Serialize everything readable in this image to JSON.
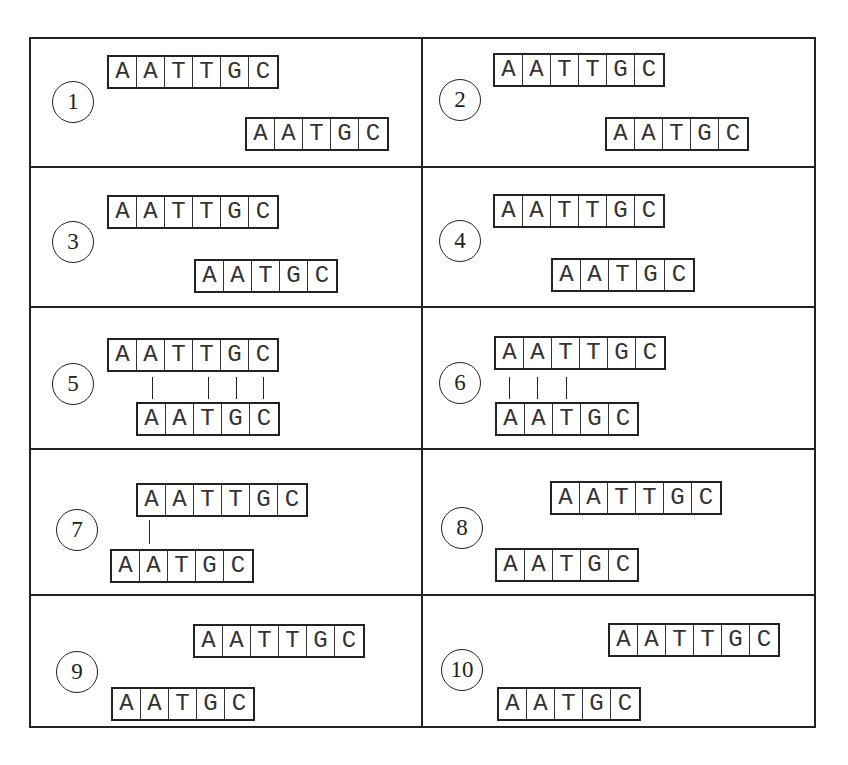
{
  "figure": {
    "frame": {
      "left": 29,
      "top": 37,
      "width": 787,
      "height": 691
    },
    "column_divider_x": 421,
    "row_divider_y": [
      166,
      306,
      448,
      594
    ],
    "cell_width": 28,
    "colors": {
      "line": "#222222",
      "text": "#333333",
      "background": "#ffffff"
    }
  },
  "panels": [
    {
      "number": "1",
      "circle": {
        "x": 73,
        "y": 102
      },
      "top_seq": {
        "x": 107,
        "y": 55,
        "letters": [
          "A",
          "A",
          "T",
          "T",
          "G",
          "C"
        ]
      },
      "bottom_seq": {
        "x": 245,
        "y": 117,
        "letters": [
          "A",
          "A",
          "T",
          "G",
          "C"
        ]
      },
      "pair_lines": []
    },
    {
      "number": "2",
      "circle": {
        "x": 460,
        "y": 100
      },
      "top_seq": {
        "x": 493,
        "y": 53,
        "letters": [
          "A",
          "A",
          "T",
          "T",
          "G",
          "C"
        ]
      },
      "bottom_seq": {
        "x": 605,
        "y": 117,
        "letters": [
          "A",
          "A",
          "T",
          "G",
          "C"
        ]
      },
      "pair_lines": []
    },
    {
      "number": "3",
      "circle": {
        "x": 73,
        "y": 242
      },
      "top_seq": {
        "x": 107,
        "y": 195,
        "letters": [
          "A",
          "A",
          "T",
          "T",
          "G",
          "C"
        ]
      },
      "bottom_seq": {
        "x": 194,
        "y": 259,
        "letters": [
          "A",
          "A",
          "T",
          "G",
          "C"
        ]
      },
      "pair_lines": []
    },
    {
      "number": "4",
      "circle": {
        "x": 460,
        "y": 241
      },
      "top_seq": {
        "x": 493,
        "y": 194,
        "letters": [
          "A",
          "A",
          "T",
          "T",
          "G",
          "C"
        ]
      },
      "bottom_seq": {
        "x": 551,
        "y": 258,
        "letters": [
          "A",
          "A",
          "T",
          "G",
          "C"
        ]
      },
      "pair_lines": []
    },
    {
      "number": "5",
      "circle": {
        "x": 73,
        "y": 384
      },
      "top_seq": {
        "x": 107,
        "y": 338,
        "letters": [
          "A",
          "A",
          "T",
          "T",
          "G",
          "C"
        ]
      },
      "bottom_seq": {
        "x": 136,
        "y": 402,
        "letters": [
          "A",
          "A",
          "T",
          "G",
          "C"
        ]
      },
      "pair_lines": [
        {
          "x": 152,
          "y1": 377,
          "y2": 399
        },
        {
          "x": 208,
          "y1": 377,
          "y2": 399
        },
        {
          "x": 236,
          "y1": 377,
          "y2": 399
        },
        {
          "x": 263,
          "y1": 377,
          "y2": 399
        }
      ]
    },
    {
      "number": "6",
      "circle": {
        "x": 460,
        "y": 383
      },
      "top_seq": {
        "x": 494,
        "y": 336,
        "letters": [
          "A",
          "A",
          "T",
          "T",
          "G",
          "C"
        ]
      },
      "bottom_seq": {
        "x": 495,
        "y": 402,
        "letters": [
          "A",
          "A",
          "T",
          "G",
          "C"
        ]
      },
      "pair_lines": [
        {
          "x": 509,
          "y1": 377,
          "y2": 399
        },
        {
          "x": 537,
          "y1": 377,
          "y2": 399
        },
        {
          "x": 566,
          "y1": 377,
          "y2": 399
        }
      ]
    },
    {
      "number": "7",
      "circle": {
        "x": 77,
        "y": 530
      },
      "top_seq": {
        "x": 136,
        "y": 483,
        "letters": [
          "A",
          "A",
          "T",
          "T",
          "G",
          "C"
        ]
      },
      "bottom_seq": {
        "x": 110,
        "y": 549,
        "letters": [
          "A",
          "A",
          "T",
          "G",
          "C"
        ]
      },
      "pair_lines": [
        {
          "x": 149,
          "y1": 520,
          "y2": 544
        }
      ]
    },
    {
      "number": "8",
      "circle": {
        "x": 462,
        "y": 528
      },
      "top_seq": {
        "x": 550,
        "y": 481,
        "letters": [
          "A",
          "A",
          "T",
          "T",
          "G",
          "C"
        ]
      },
      "bottom_seq": {
        "x": 495,
        "y": 548,
        "letters": [
          "A",
          "A",
          "T",
          "G",
          "C"
        ]
      },
      "pair_lines": []
    },
    {
      "number": "9",
      "circle": {
        "x": 77,
        "y": 672
      },
      "top_seq": {
        "x": 193,
        "y": 624,
        "letters": [
          "A",
          "A",
          "T",
          "T",
          "G",
          "C"
        ]
      },
      "bottom_seq": {
        "x": 111,
        "y": 687,
        "letters": [
          "A",
          "A",
          "T",
          "G",
          "C"
        ]
      },
      "pair_lines": []
    },
    {
      "number": "10",
      "circle": {
        "x": 462,
        "y": 670
      },
      "top_seq": {
        "x": 608,
        "y": 623,
        "letters": [
          "A",
          "A",
          "T",
          "T",
          "G",
          "C"
        ]
      },
      "bottom_seq": {
        "x": 497,
        "y": 687,
        "letters": [
          "A",
          "A",
          "T",
          "G",
          "C"
        ]
      },
      "pair_lines": []
    }
  ]
}
